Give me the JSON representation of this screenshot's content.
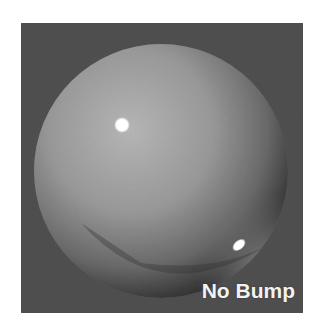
{
  "image": {
    "description": "Rendered shiny sphere on dark gray background, no bump mapping",
    "caption": "No Bump",
    "colors": {
      "background": "#505050",
      "sphere_light": "#b4b4b4",
      "sphere_mid": "#8a8a8a",
      "sphere_dark": "#3a3a3a",
      "highlight": "#ffffff",
      "page": "#ffffff"
    }
  }
}
